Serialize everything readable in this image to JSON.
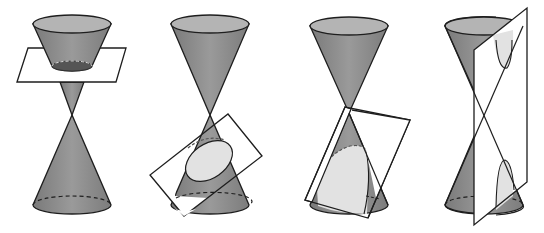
{
  "diagram": {
    "colors": {
      "cone_fill": "#8c8c8c",
      "cone_rim": "#b4b4b4",
      "section_light": "#e2e2e2",
      "section_dark": "#555555",
      "plane_fill": "#ffffff",
      "stroke": "#1e1e1e"
    },
    "panels": [
      {
        "id": "circle",
        "section": "circle",
        "plane": "horizontal"
      },
      {
        "id": "ellipse",
        "section": "ellipse",
        "plane": "tilted"
      },
      {
        "id": "parabola",
        "section": "parabola",
        "plane": "parallel to side"
      },
      {
        "id": "hyperbola",
        "section": "hyperbola",
        "plane": "vertical"
      }
    ]
  }
}
